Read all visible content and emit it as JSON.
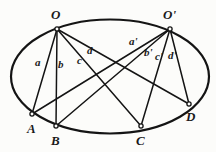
{
  "figure": {
    "stroke_color": "#141414",
    "background_color": "#fcfcfa",
    "ellipse": {
      "cx": 110,
      "cy": 76.5,
      "rx": 99,
      "ry": 57,
      "stroke_width": 2.2
    },
    "vertices": [
      {
        "id": "O",
        "label": "O",
        "x": 57,
        "y": 29,
        "label_x": 51,
        "label_y": 8,
        "marker": "open-dot"
      },
      {
        "id": "Op",
        "label": "O'",
        "x": 170,
        "y": 29,
        "label_x": 163,
        "label_y": 8,
        "marker": "open-dot"
      },
      {
        "id": "A",
        "label": "A",
        "x": 32,
        "y": 114,
        "label_x": 27,
        "label_y": 122,
        "marker": "open-dot"
      },
      {
        "id": "B",
        "label": "B",
        "x": 56,
        "y": 126,
        "label_x": 51,
        "label_y": 134,
        "marker": "open-dot"
      },
      {
        "id": "C",
        "label": "C",
        "x": 141,
        "y": 126,
        "label_x": 136,
        "label_y": 134,
        "marker": "open-dot"
      },
      {
        "id": "D",
        "label": "D",
        "x": 189,
        "y": 104,
        "label_x": 186,
        "label_y": 110,
        "marker": "open-dot"
      }
    ],
    "segments": [
      {
        "id": "OA",
        "from": "O",
        "to": "A",
        "label": "a",
        "label_x": 35,
        "label_y": 57
      },
      {
        "id": "OB",
        "from": "O",
        "to": "B",
        "label": "b",
        "label_x": 58,
        "label_y": 59
      },
      {
        "id": "OC",
        "from": "O",
        "to": "C",
        "label": "c",
        "label_x": 77,
        "label_y": 55
      },
      {
        "id": "OD",
        "from": "O",
        "to": "D",
        "label": "d",
        "label_x": 87,
        "label_y": 45
      },
      {
        "id": "OpA",
        "from": "Op",
        "to": "A",
        "label": "a'",
        "label_x": 129,
        "label_y": 36
      },
      {
        "id": "OpB",
        "from": "Op",
        "to": "B",
        "label": "b'",
        "label_x": 144,
        "label_y": 47
      },
      {
        "id": "OpC",
        "from": "Op",
        "to": "C",
        "label": "c'",
        "label_x": 155,
        "label_y": 51
      },
      {
        "id": "OpD",
        "from": "Op",
        "to": "D",
        "label": "d'",
        "label_x": 168,
        "label_y": 50
      }
    ]
  }
}
